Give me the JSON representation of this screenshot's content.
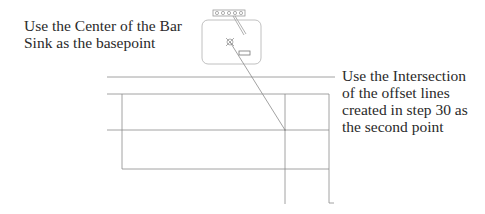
{
  "annotations": {
    "left": "Use the Center of the Bar\nSink as the basepoint",
    "right": "Use the Intersection\nof the offset lines\ncreated in step 30 as\nthe second point"
  },
  "drawing": {
    "elements": [
      {
        "type": "faucet",
        "label": "faucet"
      },
      {
        "type": "bar-sink",
        "label": "Bar Sink"
      },
      {
        "type": "move-line",
        "from": "Center of the Bar Sink",
        "to": "Intersection of offset lines"
      },
      {
        "type": "offset-lines",
        "label": "offset lines created in step 30"
      }
    ],
    "colors": {
      "line": "#8a8a8a",
      "sink": "#b0b0b0",
      "text": "#2a2a2a"
    }
  }
}
